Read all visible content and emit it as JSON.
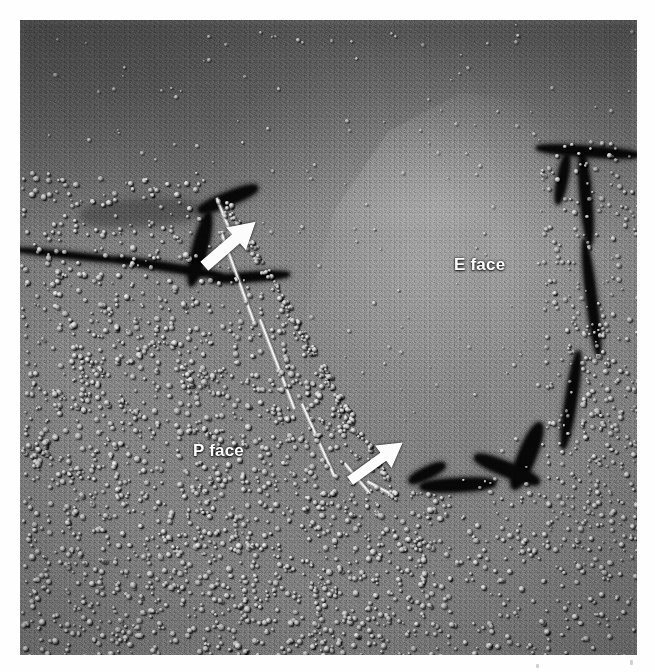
{
  "page": {
    "background_color": "#ffffff"
  },
  "micrograph": {
    "name": "freeze-fracture-replica-micrograph",
    "modality": "transmission electron microscopy of a platinum-carbon freeze-fracture replica",
    "frame": {
      "left": 20,
      "top": 20,
      "width": 617,
      "height": 635
    },
    "background_color": "#6e6e6e",
    "shadowing_direction": "upper-left highlight, lower-right shadow",
    "regions": [
      {
        "id": "e-face",
        "label": "E face",
        "description": "smooth exoplasmic fracture face with sparse intramembrane particles",
        "tone": "light gray",
        "particle_density": "sparse"
      },
      {
        "id": "p-face",
        "label": "P face",
        "description": "protoplasmic fracture face densely studded with intramembrane particles",
        "tone": "mid gray",
        "particle_density": "dense"
      }
    ]
  },
  "labels": [
    {
      "id": "label-eface",
      "text": "E face",
      "color": "#ffffff",
      "x": 434,
      "y": 235
    },
    {
      "id": "label-pface",
      "text": "P face",
      "color": "#ffffff",
      "x": 173,
      "y": 421
    }
  ],
  "annotations": {
    "arrows": [
      {
        "id": "arrow-upper",
        "points_to": "fracture step between P face and E face",
        "direction": "up-right",
        "color": "#ffffff",
        "x": 190,
        "y": 205
      },
      {
        "id": "arrow-lower",
        "points_to": "fracture step between P face and E face",
        "direction": "up-right",
        "color": "#ffffff",
        "x": 336,
        "y": 424
      }
    ],
    "features": [
      {
        "id": "fracture-step",
        "description": "bright diagonal ridge where the fracture plane jumps between membrane leaflets"
      },
      {
        "id": "left-crack",
        "description": "dark fracture crack running in from the left margin"
      },
      {
        "id": "right-crack",
        "description": "branching dark crack at the right margin"
      },
      {
        "id": "lower-boundary",
        "description": "deep dark shadow bounding the lower-right edge of the E face"
      }
    ]
  }
}
